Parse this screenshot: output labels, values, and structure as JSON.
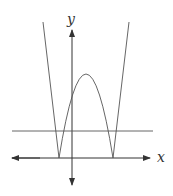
{
  "figure": {
    "axes": {
      "x_label": "x",
      "y_label": "y"
    },
    "curves": [
      {
        "name": "w-shaped-curve",
        "shape": "absolute value of downward parabola (W shape)"
      },
      {
        "name": "horizontal-line",
        "shape": "horizontal line above x-axis crossing curve at 4 points"
      }
    ],
    "colors": {
      "curve": "#555555",
      "axes": "#333333",
      "background": "#ffffff"
    }
  }
}
